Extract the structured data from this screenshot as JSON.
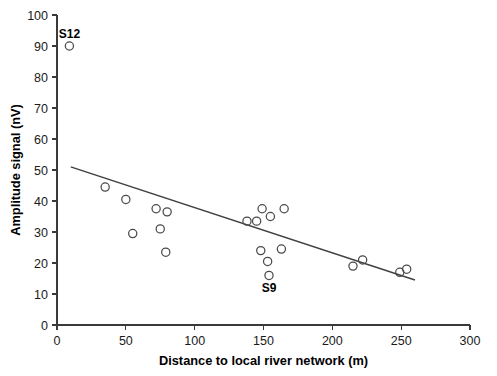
{
  "chart_data": {
    "type": "scatter",
    "title": "",
    "xlabel": "Distance to local river network (m)",
    "ylabel": "Amplitude signal (nV)",
    "xlim": [
      0,
      300
    ],
    "ylim": [
      0,
      100
    ],
    "xticks": [
      0,
      50,
      100,
      150,
      200,
      250,
      300
    ],
    "yticks": [
      0,
      10,
      20,
      30,
      40,
      50,
      60,
      70,
      80,
      90,
      100
    ],
    "grid": false,
    "legend": "none",
    "points": [
      {
        "x": 9,
        "y": 90,
        "label": "S12",
        "label_position": "above"
      },
      {
        "x": 35,
        "y": 44.5,
        "label": "",
        "label_position": ""
      },
      {
        "x": 50,
        "y": 40.5,
        "label": "",
        "label_position": ""
      },
      {
        "x": 55,
        "y": 29.5,
        "label": "",
        "label_position": ""
      },
      {
        "x": 72,
        "y": 37.5,
        "label": "",
        "label_position": ""
      },
      {
        "x": 75,
        "y": 31,
        "label": "",
        "label_position": ""
      },
      {
        "x": 80,
        "y": 36.5,
        "label": "",
        "label_position": ""
      },
      {
        "x": 79,
        "y": 23.5,
        "label": "",
        "label_position": ""
      },
      {
        "x": 138,
        "y": 33.5,
        "label": "",
        "label_position": ""
      },
      {
        "x": 145,
        "y": 33.5,
        "label": "",
        "label_position": ""
      },
      {
        "x": 149,
        "y": 37.5,
        "label": "",
        "label_position": ""
      },
      {
        "x": 155,
        "y": 35,
        "label": "",
        "label_position": ""
      },
      {
        "x": 165,
        "y": 37.5,
        "label": "",
        "label_position": ""
      },
      {
        "x": 148,
        "y": 24,
        "label": "",
        "label_position": ""
      },
      {
        "x": 163,
        "y": 24.5,
        "label": "",
        "label_position": ""
      },
      {
        "x": 153,
        "y": 20.5,
        "label": "",
        "label_position": ""
      },
      {
        "x": 154,
        "y": 16,
        "label": "S9",
        "label_position": "below"
      },
      {
        "x": 215,
        "y": 19,
        "label": "",
        "label_position": ""
      },
      {
        "x": 222,
        "y": 21,
        "label": "",
        "label_position": ""
      },
      {
        "x": 249,
        "y": 17,
        "label": "",
        "label_position": ""
      },
      {
        "x": 254,
        "y": 18,
        "label": "",
        "label_position": ""
      }
    ],
    "fit_line": {
      "x_start": 10,
      "y_start": 51,
      "x_end": 260,
      "y_end": 14.5
    }
  }
}
